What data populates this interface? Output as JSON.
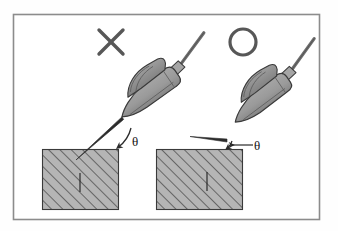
{
  "figure": {
    "background_color": "#fefefe",
    "frame": {
      "name": "outer-frame",
      "stroke": "#8c8c8c",
      "fill": "#ffffff",
      "x": 13,
      "y": 14,
      "width": 307,
      "height": 206
    },
    "panels": [
      {
        "id": "left",
        "verdict_mark": "×",
        "verdict_meaning": "incorrect",
        "mark_color": "#575757",
        "angle_label": "θ",
        "angle_description": "steep probe tilt angle - not recommended",
        "block": {
          "name": "workpiece-left",
          "fill": "#b3b3b3",
          "stroke": "#3a3a3a",
          "hatch_color": "#3a3a3a"
        }
      },
      {
        "id": "right",
        "verdict_mark": "○",
        "verdict_meaning": "correct",
        "mark_color": "#575757",
        "angle_label": "θ",
        "angle_description": "shallow probe tilt angle - recommended",
        "block": {
          "name": "workpiece-right",
          "fill": "#b3b3b3",
          "stroke": "#3a3a3a",
          "hatch_color": "#3a3a3a"
        }
      }
    ],
    "probe": {
      "name": "stylus-probe",
      "body_fill": "#9a9a9a",
      "body_stroke": "#3a3a3a",
      "bulge_fill": "#8f8f8f",
      "connector_fill": "#a5a5a5",
      "cable_stroke": "#6e6e6e",
      "needle_stroke": "#2b2b2b"
    },
    "colors": {
      "line": "#3a3a3a",
      "mid_gray": "#9a9a9a",
      "block_gray": "#b3b3b3",
      "mark_gray": "#575757",
      "frame_gray": "#8c8c8c"
    }
  }
}
